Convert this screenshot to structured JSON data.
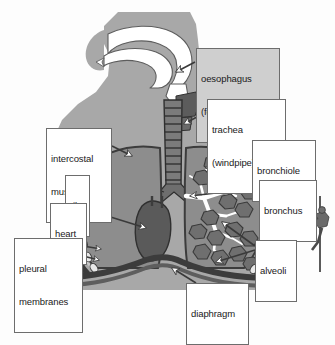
{
  "figure": {
    "background_color": "#fdfdfd",
    "body_silhouette_color": "#a8a8a8",
    "airway_color": "#ffffff",
    "lung_tissue_color": "#8d8d8d",
    "ribcage_color": "#4a4a4a",
    "heart_color": "#5a5a5a",
    "alveoli_color": "#6f6f6f",
    "label_box_fill": "#ffffff",
    "label_box_border": "#6d6d6d",
    "label_text_color": "#1a1a1a",
    "arrow_fill": "#ffffff",
    "arrow_stroke": "#3a3a3a"
  },
  "labels": [
    {
      "id": "oesophagus",
      "lines": [
        "oesophagus",
        "(food pipe)"
      ],
      "box": {
        "x": 196,
        "y": 48,
        "w": 84,
        "h": 27
      },
      "shaded": true,
      "points_to": "oesophagus-structure"
    },
    {
      "id": "trachea",
      "lines": [
        "trachea",
        "(windpipe)"
      ],
      "box": {
        "x": 207,
        "y": 99,
        "w": 79,
        "h": 27
      },
      "shaded": false,
      "points_to": "trachea-structure"
    },
    {
      "id": "intercostal-muscle",
      "lines": [
        "intercostal",
        "muscle"
      ],
      "box": {
        "x": 46,
        "y": 128,
        "w": 66,
        "h": 27
      },
      "shaded": false,
      "points_to": "intercostal-muscle-structure"
    },
    {
      "id": "rib",
      "lines": [
        "rib"
      ],
      "box": {
        "x": 65,
        "y": 175,
        "w": 25,
        "h": 14
      },
      "shaded": false,
      "points_to": "rib-structure"
    },
    {
      "id": "heart",
      "lines": [
        "heart"
      ],
      "box": {
        "x": 50,
        "y": 203,
        "w": 37,
        "h": 14
      },
      "shaded": false,
      "points_to": "heart-structure"
    },
    {
      "id": "pleural-membranes",
      "lines": [
        "pleural",
        "membranes"
      ],
      "box": {
        "x": 14,
        "y": 238,
        "w": 69,
        "h": 28
      },
      "shaded": false,
      "points_to": "pleural-membranes-structure"
    },
    {
      "id": "bronchiole",
      "lines": [
        "bronchiole"
      ],
      "box": {
        "x": 252,
        "y": 140,
        "w": 64,
        "h": 15
      },
      "shaded": false,
      "points_to": "bronchiole-structure"
    },
    {
      "id": "bronchus",
      "lines": [
        "bronchus"
      ],
      "box": {
        "x": 259,
        "y": 180,
        "w": 58,
        "h": 15
      },
      "shaded": false,
      "points_to": "bronchus-structure"
    },
    {
      "id": "alveoli",
      "lines": [
        "alveoli"
      ],
      "box": {
        "x": 255,
        "y": 240,
        "w": 42,
        "h": 15
      },
      "shaded": false,
      "points_to": "alveoli-structure"
    },
    {
      "id": "diaphragm",
      "lines": [
        "diaphragm"
      ],
      "box": {
        "x": 186,
        "y": 283,
        "w": 63,
        "h": 15
      },
      "shaded": false,
      "points_to": "diaphragm-structure"
    }
  ],
  "decorations": [
    {
      "id": "climber",
      "name": "abseiling-climber-illustration",
      "description": "small grayscale figure abseiling down a rope at the right margin"
    }
  ]
}
